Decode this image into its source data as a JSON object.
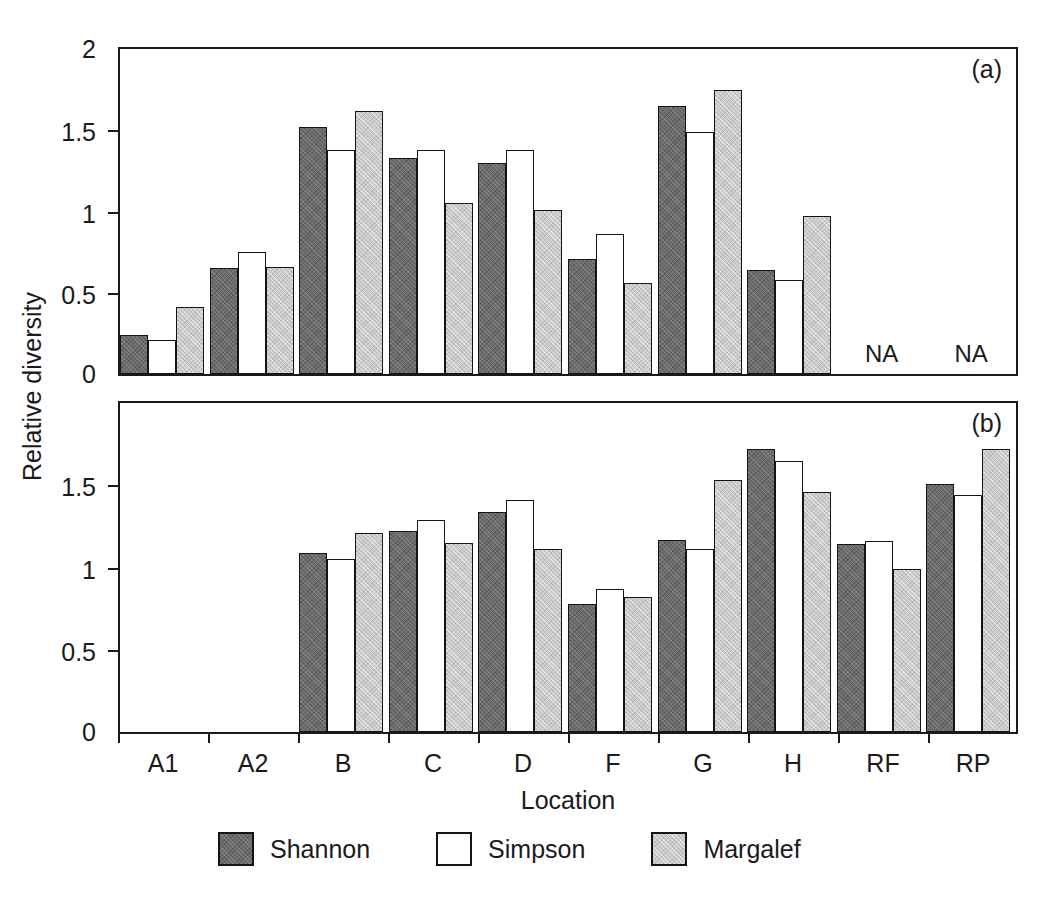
{
  "chart_data": {
    "type": "bar",
    "title": "",
    "xlabel": "Location",
    "ylabel": "Relative diversity",
    "grid": false,
    "legend_position": "bottom",
    "legend": [
      "Shannon",
      "Simpson",
      "Margalef"
    ],
    "categories": [
      "A1",
      "A2",
      "B",
      "C",
      "D",
      "F",
      "G",
      "H",
      "RF",
      "RP"
    ],
    "panels": [
      {
        "tag": "(a)",
        "ylim": [
          0,
          2
        ],
        "yticks": [
          0,
          0.5,
          1,
          1.5,
          2
        ],
        "ytick_labels": [
          "0",
          "0.5",
          "1",
          "1.5",
          "2"
        ],
        "series": [
          {
            "name": "Shannon",
            "values": [
              0.24,
              0.65,
              1.52,
              1.33,
              1.3,
              0.71,
              1.65,
              0.64,
              null,
              null
            ]
          },
          {
            "name": "Simpson",
            "values": [
              0.21,
              0.75,
              1.38,
              1.38,
              1.38,
              0.86,
              1.49,
              0.58,
              null,
              null
            ]
          },
          {
            "name": "Margalef",
            "values": [
              0.41,
              0.66,
              1.62,
              1.05,
              1.01,
              0.56,
              1.75,
              0.97,
              null,
              null
            ]
          }
        ],
        "annotations": [
          {
            "category": "RF",
            "text": "NA"
          },
          {
            "category": "RP",
            "text": "NA"
          }
        ]
      },
      {
        "tag": "(b)",
        "ylim": [
          0,
          2
        ],
        "yticks": [
          0,
          0.5,
          1,
          1.5
        ],
        "ytick_labels": [
          "0",
          "0.5",
          "1",
          "1.5"
        ],
        "series": [
          {
            "name": "Shannon",
            "values": [
              null,
              null,
              1.09,
              1.22,
              1.34,
              0.78,
              1.17,
              1.72,
              1.14,
              1.51
            ]
          },
          {
            "name": "Simpson",
            "values": [
              null,
              null,
              1.05,
              1.29,
              1.41,
              0.87,
              1.11,
              1.65,
              1.16,
              1.44
            ]
          },
          {
            "name": "Margalef",
            "values": [
              null,
              null,
              1.21,
              1.15,
              1.11,
              0.82,
              1.53,
              1.46,
              0.99,
              1.72
            ]
          }
        ],
        "annotations": []
      }
    ],
    "colors": {
      "shannon": "#6b6b6b",
      "simpson": "#ffffff",
      "margalef": "#c9c9c9",
      "axis": "#1a1a1a",
      "background": "#ffffff"
    }
  }
}
